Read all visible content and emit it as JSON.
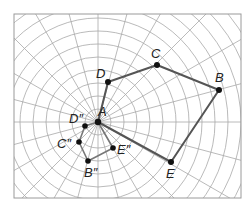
{
  "diagram": {
    "type": "polar-grid dilation figure",
    "frame": {
      "x": 14,
      "y": 14,
      "width": 227,
      "height": 184,
      "stroke": "#9a9a9a"
    },
    "grid": {
      "center": {
        "x": 98,
        "y": 122
      },
      "ring_spacing": 13,
      "ring_count": 14,
      "ray_count": 24,
      "stroke": "#a8a8a8"
    },
    "colors": {
      "figure_stroke": "#555555",
      "image_stroke": "#777777",
      "point_fill": "#111111",
      "label_color": "#222222"
    },
    "center_point": {
      "label": "A",
      "x": 98,
      "y": 122,
      "label_dx": 0,
      "label_dy": -6
    },
    "original_figure": {
      "name": "pentagon ABCDE",
      "points": [
        {
          "label": "A",
          "x": 98,
          "y": 122
        },
        {
          "label": "B",
          "x": 219,
          "y": 90,
          "label_dx": -4,
          "label_dy": -8
        },
        {
          "label": "C",
          "x": 157,
          "y": 65,
          "label_dx": -6,
          "label_dy": -7
        },
        {
          "label": "D",
          "x": 108,
          "y": 82,
          "label_dx": -12,
          "label_dy": -4
        },
        {
          "label": "E",
          "x": 171,
          "y": 162,
          "label_dx": -5,
          "label_dy": 16
        }
      ],
      "edges": [
        [
          "D",
          "C"
        ],
        [
          "C",
          "B"
        ],
        [
          "B",
          "E"
        ],
        [
          "E",
          "A"
        ],
        [
          "A",
          "D"
        ]
      ]
    },
    "image_figure": {
      "name": "dilated image",
      "points": [
        {
          "label": "D″",
          "x": 85,
          "y": 126,
          "label_dx": -16,
          "label_dy": -3
        },
        {
          "label": "C″",
          "x": 79,
          "y": 142,
          "label_dx": -22,
          "label_dy": 6
        },
        {
          "label": "B″",
          "x": 88,
          "y": 161,
          "label_dx": -4,
          "label_dy": 16
        },
        {
          "label": "E″",
          "x": 113,
          "y": 148,
          "label_dx": 4,
          "label_dy": 6
        }
      ],
      "edges": [
        [
          "D″",
          "C″"
        ],
        [
          "C″",
          "B″"
        ],
        [
          "B″",
          "E″"
        ],
        [
          "E″",
          "A"
        ],
        [
          "A",
          "D″"
        ]
      ]
    }
  }
}
